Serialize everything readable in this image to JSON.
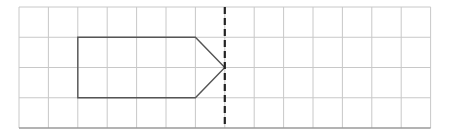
{
  "grid": {
    "left": 19,
    "top": 7,
    "cols": 14,
    "rows": 4,
    "cell_w": 29.4,
    "cell_h": 30.25,
    "line_color": "#c8c8c8",
    "border_color": "#9a9a9a"
  },
  "mirror_line": {
    "col": 7,
    "style": "dashed",
    "color": "#222222"
  },
  "shape": {
    "type": "pentagon-arrow",
    "stroke": "#555555",
    "points_grid": [
      [
        2,
        1
      ],
      [
        6,
        1
      ],
      [
        7,
        2
      ],
      [
        6,
        3
      ],
      [
        2,
        3
      ]
    ]
  }
}
